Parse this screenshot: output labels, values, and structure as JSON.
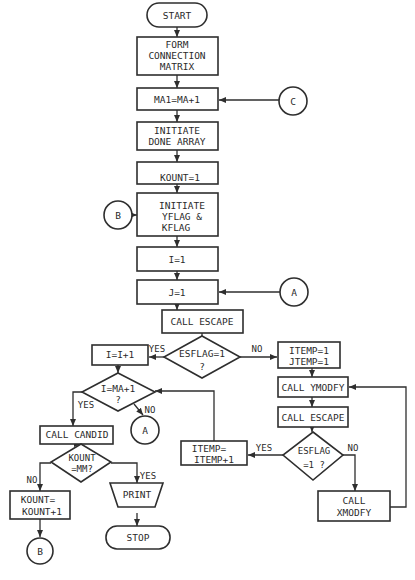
{
  "diagram": {
    "type": "flowchart",
    "nodes": {
      "start": {
        "shape": "terminal",
        "label": "START"
      },
      "form_matrix": {
        "shape": "process",
        "lines": [
          "FORM",
          "CONNECTION",
          "MATRIX"
        ]
      },
      "ma1": {
        "shape": "process",
        "label": "MA1=MA+1"
      },
      "init_done": {
        "shape": "process",
        "lines": [
          "INITIATE",
          "DONE ARRAY"
        ]
      },
      "kount1": {
        "shape": "process",
        "label": "KOUNT=1"
      },
      "init_flags": {
        "shape": "process",
        "lines": [
          "INITIATE",
          "YFLAG &",
          "KFLAG"
        ]
      },
      "i1": {
        "shape": "process",
        "label": "I=1"
      },
      "j1": {
        "shape": "process",
        "label": "J=1"
      },
      "call_escape_1": {
        "shape": "process",
        "label": "CALL ESCAPE"
      },
      "esflag_1": {
        "shape": "decision",
        "lines": [
          "ESFLAG=1",
          "?"
        ]
      },
      "i_inc": {
        "shape": "process",
        "label": "I=I+1"
      },
      "i_eq_ma": {
        "shape": "decision",
        "lines": [
          "I=MA+1",
          "?"
        ]
      },
      "call_candid": {
        "shape": "process",
        "label": "CALL CANDID"
      },
      "kount_mm": {
        "shape": "decision",
        "lines": [
          "KOUNT",
          "=MM?"
        ]
      },
      "kount_inc": {
        "shape": "process",
        "lines": [
          "KOUNT=",
          "KOUNT+1"
        ]
      },
      "print": {
        "shape": "manual-operation",
        "label": "PRINT"
      },
      "stop": {
        "shape": "terminal",
        "label": "STOP"
      },
      "itemp_init": {
        "shape": "process",
        "lines": [
          "ITEMP=1",
          "JTEMP=1"
        ]
      },
      "call_ymodfy": {
        "shape": "process",
        "label": "CALL YMODFY"
      },
      "call_escape_2": {
        "shape": "process",
        "label": "CALL ESCAPE"
      },
      "esflag_2": {
        "shape": "decision",
        "lines": [
          "ESFLAG",
          "=1 ?"
        ]
      },
      "itemp_inc": {
        "shape": "process",
        "lines": [
          "ITEMP=",
          "ITEMP+1"
        ]
      },
      "call_xmodfy": {
        "shape": "process",
        "lines": [
          "CALL",
          "XMODFY"
        ]
      }
    },
    "connectors": {
      "c_in": "C",
      "b_in": "B",
      "a_in": "A",
      "a_out": "A",
      "b_out": "B"
    },
    "edge_labels": {
      "esflag1_yes": "YES",
      "esflag1_no": "NO",
      "ima_yes": "YES",
      "ima_no": "NO",
      "kount_no": "NO",
      "kount_yes": "YES",
      "esflag2_yes": "YES",
      "esflag2_no": "NO"
    }
  }
}
